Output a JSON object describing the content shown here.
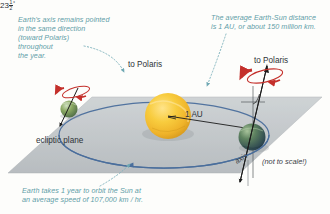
{
  "diagram": {
    "background_color": "#fdfdfb",
    "annotation_color": "#5f9ea8",
    "label_color": "#2e3338"
  },
  "annotations": {
    "axis_note": "Earth's axis remains pointed\nin the same direction\n(toward Polaris)\nthroughout\nthe year.",
    "distance_note": "The average Earth-Sun distance\nis 1 AU, or about 150 million km.",
    "orbit_note": "Earth takes 1 year to orbit the Sun at\nan average speed of 107,000 km / hr."
  },
  "labels": {
    "polaris_left": "to Polaris",
    "polaris_right": "to Polaris",
    "ecliptic_plane": "ecliptic plane",
    "distance_au": "1 AU",
    "not_to_scale": "(not to scale!)",
    "axis": "axis",
    "tilt_whole": "23",
    "tilt_numerator": "1",
    "tilt_denominator": "2",
    "tilt_degree": "°"
  },
  "colors": {
    "ecliptic_plane_fill": "#b9bec2",
    "orbit_line": "#4a6e9c",
    "sun_core": "#f7c game",
    "sun": "#f5c133",
    "earth_land": "#7a9b52",
    "earth_ocean": "#3f6a84",
    "rotation_arrow": "#c4302b",
    "leader_line": "#7fb3bd"
  },
  "objects": {
    "sun_name": "Sun",
    "earth_left_name": "Earth",
    "earth_right_name": "Earth"
  }
}
